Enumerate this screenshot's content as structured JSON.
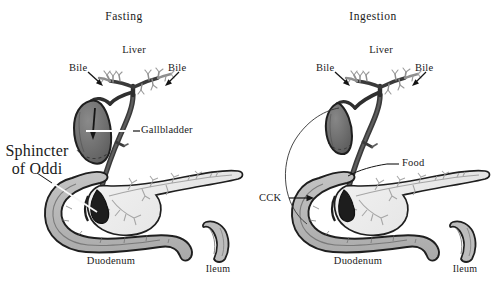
{
  "figure": {
    "background_color": "#ffffff",
    "width": 494,
    "height": 282
  },
  "palette": {
    "outline": "#1a1a1a",
    "gallbladder_fill": "#6e6e6e",
    "gallbladder_fill_contracted": "#6a6a6a",
    "duct_fill": "#4a4a4a",
    "duodenum_fill": "#b8b8b8",
    "duodenum_wall": "#8f8f8f",
    "pancreas_fill": "#ededed",
    "pancreas_duct": "#9a9a9a",
    "ileum_fill": "#bdbdbd",
    "leader_line": "#2b2b2b",
    "text": "#1a1a1a"
  },
  "panels": [
    {
      "id": "fasting",
      "title": "Fasting",
      "labels": {
        "liver": "Liver",
        "bile_left": "Bile",
        "bile_right": "Bile",
        "gallbladder": "Gallbladder",
        "sphincter_line1": "Sphincter",
        "sphincter_line2": "of Oddi",
        "duodenum": "Duodenum",
        "ileum": "Ileum"
      },
      "annotations": [
        {
          "name": "bile-arrow-left",
          "type": "arrow",
          "points_to": "bile-duct-left-branch"
        },
        {
          "name": "bile-arrow-right",
          "type": "arrow",
          "points_to": "bile-duct-right-branch"
        },
        {
          "name": "gallbladder-leader",
          "type": "leader-line",
          "points_to": "gallbladder"
        },
        {
          "name": "sphincter-leader",
          "type": "leader-line",
          "points_to": "sphincter-of-oddi"
        },
        {
          "name": "bile-flow-arrow",
          "type": "arrow-in-gallbladder",
          "direction": "down"
        }
      ],
      "gallbladder_state": "distended"
    },
    {
      "id": "ingestion",
      "title": "Ingestion",
      "labels": {
        "liver": "Liver",
        "bile_left": "Bile",
        "bile_right": "Bile",
        "cck": "CCK",
        "food": "Food",
        "duodenum": "Duodenum",
        "ileum": "Ileum"
      },
      "annotations": [
        {
          "name": "bile-arrow-left",
          "type": "arrow",
          "points_to": "bile-duct-left-branch"
        },
        {
          "name": "bile-arrow-right",
          "type": "arrow",
          "points_to": "bile-duct-right-branch"
        },
        {
          "name": "cck-arrow",
          "type": "arrow",
          "points_to": "duodenum-wall"
        },
        {
          "name": "cck-arc",
          "type": "curved-line",
          "from": "duodenum",
          "to": "gallbladder"
        },
        {
          "name": "food-leader",
          "type": "leader-line",
          "points_to": "duodenal-lumen"
        }
      ],
      "gallbladder_state": "contracted"
    }
  ]
}
